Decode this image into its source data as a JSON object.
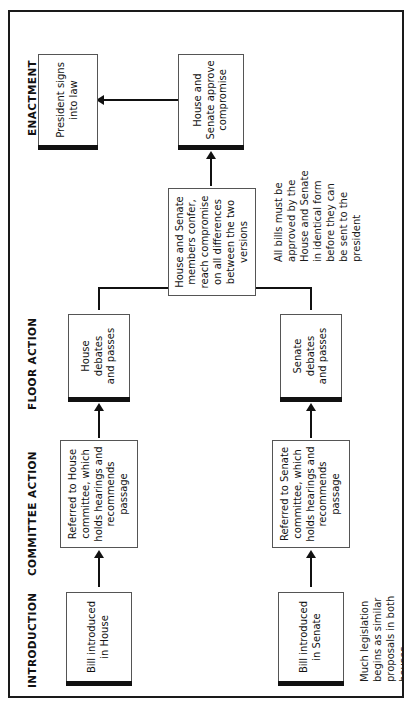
{
  "diagram": {
    "orientation": "rotated-90-ccw",
    "sections": [
      {
        "name": "introduction",
        "label": "INTRODUCTION"
      },
      {
        "name": "committee-action",
        "label": "COMMITTEE ACTION"
      },
      {
        "name": "floor-action",
        "label": "FLOOR ACTION"
      },
      {
        "name": "enactment",
        "label": "ENACTMENT\nINTO LAW"
      }
    ],
    "nodes": [
      {
        "id": "bill-house",
        "label": "Bill introduced\nin House"
      },
      {
        "id": "bill-senate",
        "label": "Bill introduced\nin Senate"
      },
      {
        "id": "house-committee",
        "label": "Referred to House\ncommittee, which\nholds hearings and\nrecommends\npassage"
      },
      {
        "id": "senate-committee",
        "label": "Referred to Senate\ncommittee, which\nholds hearings and\nrecommends\npassage"
      },
      {
        "id": "house-floor",
        "label": "House debates\nand passes"
      },
      {
        "id": "senate-floor",
        "label": "Senate debates\nand passes"
      },
      {
        "id": "conference",
        "label": "House and Senate\nmembers confer,\nreach compromise\non all differences\nbetween the two\nversions"
      },
      {
        "id": "approve",
        "label": "House and\nSenate approve\ncompromise"
      },
      {
        "id": "president",
        "label": "President signs\ninto law"
      }
    ],
    "notes": [
      {
        "id": "note-both-houses",
        "text": "Much legislation\nbegins as similar\nproposals in both\nhouses"
      },
      {
        "id": "note-identical-form",
        "text": "All bills must be\napproved by the\nHouse and Senate\nin identical form\nbefore they can\nbe sent to the\npresident"
      }
    ],
    "colors": {
      "line": "#111111",
      "box_border": "#555555",
      "background": "#ffffff",
      "text": "#111111"
    }
  }
}
